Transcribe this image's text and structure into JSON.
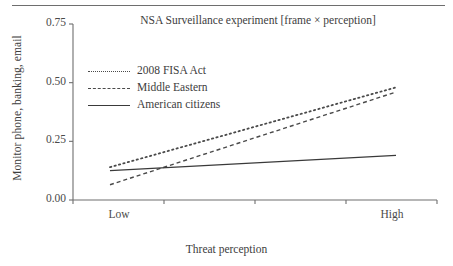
{
  "chart_data": {
    "type": "line",
    "title": "NSA Surveillance experiment [frame × perception]",
    "xlabel": "Threat perception",
    "ylabel": "Monitor phone, banking, email",
    "x": [
      0,
      1
    ],
    "xtick_labels": [
      "Low",
      "High"
    ],
    "ytick_labels": [
      "0.00",
      "0.25",
      "0.50",
      "0.75"
    ],
    "ytick_values": [
      0.0,
      0.25,
      0.5,
      0.75
    ],
    "ylim": [
      0.0,
      0.75
    ],
    "xlim": [
      0,
      1
    ],
    "grid": false,
    "legend_position": "upper-left-inside",
    "series": [
      {
        "name": "2008 FISA Act",
        "style": "dotted",
        "color": "#4a4a4a",
        "values": [
          0.14,
          0.48
        ]
      },
      {
        "name": "Middle Eastern",
        "style": "dashed",
        "color": "#4a4a4a",
        "values": [
          0.065,
          0.46
        ]
      },
      {
        "name": "American citizens",
        "style": "solid",
        "color": "#3a3a3a",
        "values": [
          0.125,
          0.19
        ]
      }
    ]
  },
  "axes": {
    "ytick_0": "0.00",
    "ytick_1": "0.25",
    "ytick_2": "0.50",
    "ytick_3": "0.75",
    "xtick_low": "Low",
    "xtick_high": "High"
  },
  "legend": {
    "items": [
      {
        "label": "2008 FISA Act"
      },
      {
        "label": "Middle Eastern"
      },
      {
        "label": "American citizens"
      }
    ]
  },
  "colors": {
    "axis": "#6e6e6e",
    "text": "#3d3d3d",
    "line_solid": "#3a3a3a",
    "line_dashed": "#4a4a4a",
    "line_dotted": "#4a4a4a",
    "background": "#ffffff"
  }
}
